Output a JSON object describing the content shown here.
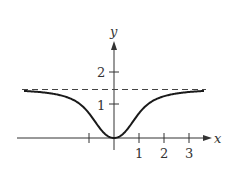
{
  "chart_data": {
    "type": "line",
    "title": "",
    "xlabel": "x",
    "ylabel": "y",
    "x_ticks": [
      -1,
      1,
      2,
      3
    ],
    "x_tick_labels": [
      "",
      "1",
      "2",
      "3"
    ],
    "y_ticks": [
      1,
      2
    ],
    "y_tick_labels": [
      "1",
      "2"
    ],
    "xlim": [
      -3.6,
      3.9
    ],
    "ylim": [
      -0.4,
      2.7
    ],
    "asymptote": {
      "y": 1.5708,
      "style": "dashed",
      "label": ""
    },
    "series": [
      {
        "name": "y = arctan(x^2)",
        "x": [
          -3.6,
          -3,
          -2.5,
          -2,
          -1.5,
          -1,
          -0.75,
          -0.5,
          -0.25,
          0,
          0.25,
          0.5,
          0.75,
          1,
          1.5,
          2,
          2.5,
          3,
          3.6
        ],
        "y": [
          1.494,
          1.46,
          1.411,
          1.326,
          1.153,
          0.785,
          0.512,
          0.245,
          0.062,
          0,
          0.062,
          0.245,
          0.512,
          0.785,
          1.153,
          1.326,
          1.411,
          1.46,
          1.494
        ]
      }
    ],
    "grid": false,
    "legend": null
  },
  "colors": {
    "curve": "#1a1a1a",
    "axis": "#333333",
    "asymptote": "#444444"
  }
}
